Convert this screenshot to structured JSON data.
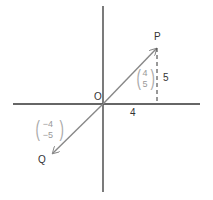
{
  "diagram": {
    "type": "vector-diagram",
    "origin_label": "O",
    "point_p_label": "P",
    "point_q_label": "Q",
    "horizontal_component_label": "4",
    "vertical_component_label": "5",
    "vector_op": {
      "top": "4",
      "bottom": "5"
    },
    "vector_oq": {
      "top": "−4",
      "bottom": "−5"
    },
    "colors": {
      "axes": "#333333",
      "vectors": "#888888",
      "text": "#333333",
      "vector_text": "#999999"
    }
  }
}
